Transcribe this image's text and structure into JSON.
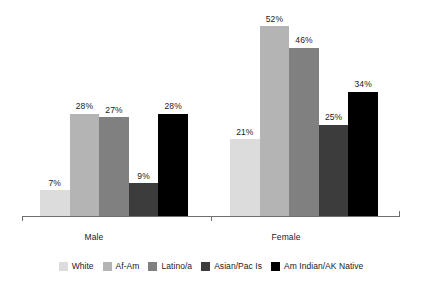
{
  "chart_data": {
    "type": "bar",
    "title": "",
    "subtitle": "",
    "xlabel": "",
    "ylabel": "",
    "categories": [
      "Male",
      "Female"
    ],
    "ylim": [
      0,
      52
    ],
    "grid": false,
    "legend_position": "bottom",
    "value_suffix": "%",
    "series": [
      {
        "name": "White",
        "color": "#dcdcdc",
        "values": [
          7,
          21
        ],
        "labels": [
          "7%",
          "21%"
        ]
      },
      {
        "name": "Af-Am",
        "color": "#b4b4b4",
        "values": [
          28,
          52
        ],
        "labels": [
          "28%",
          "52%"
        ]
      },
      {
        "name": "Latino/a",
        "color": "#808080",
        "values": [
          27,
          46
        ],
        "labels": [
          "27%",
          "46%"
        ]
      },
      {
        "name": "Asian/Pac Is",
        "color": "#3c3c3c",
        "values": [
          9,
          25
        ],
        "labels": [
          "9%",
          "25%"
        ]
      },
      {
        "name": "Am Indian/AK Native",
        "color": "#000000",
        "values": [
          28,
          34
        ],
        "labels": [
          "28%",
          "34%"
        ]
      }
    ]
  },
  "axis": {
    "male_label": "Male",
    "female_label": "Female"
  },
  "legend": {
    "items": [
      {
        "label": "White"
      },
      {
        "label": "Af-Am"
      },
      {
        "label": "Latino/a"
      },
      {
        "label": "Asian/Pac Is"
      },
      {
        "label": "Am Indian/AK Native"
      }
    ]
  },
  "colors": {
    "axis": "#6e6e6e",
    "text": "#1a1a1a",
    "background": "#ffffff"
  }
}
